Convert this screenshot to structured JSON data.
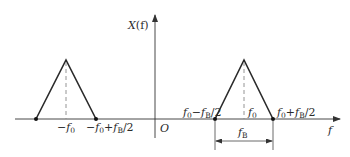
{
  "figure": {
    "y_axis_label": {
      "main": "X",
      "rest": "(f)"
    },
    "x_axis_label": "f",
    "origin_label": "O",
    "left_band": {
      "center_label": {
        "prefix": "−f",
        "sub": "0",
        "suffix": ""
      },
      "right_edge_label": {
        "p1": "−f",
        "s1": "0",
        "p2": "+f",
        "s2": "B",
        "p3": "/2"
      }
    },
    "right_band": {
      "left_edge_label": {
        "p1": "f",
        "s1": "0",
        "p2": "−f",
        "s2": "B",
        "p3": "/2"
      },
      "center_label": {
        "prefix": "f",
        "sub": "0",
        "suffix": ""
      },
      "right_edge_label": {
        "p1": "f",
        "s1": "0",
        "p2": "+f",
        "s2": "B",
        "p3": "/2"
      },
      "bandwidth_label": {
        "prefix": "f",
        "sub": "B"
      }
    }
  }
}
